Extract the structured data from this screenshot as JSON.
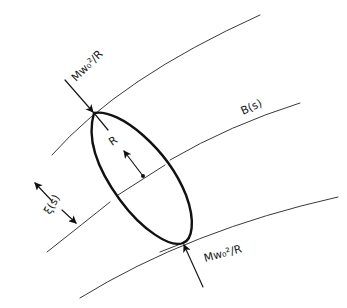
{
  "diagram": {
    "labels": {
      "force_top": "Mw₀²/R",
      "force_bottom": "Mw₀²/R",
      "radius": "R",
      "beam_path": "B(s)",
      "separation": "ξ(s)"
    },
    "elements": {
      "outer_curves": 2,
      "center_curve": "B(s)",
      "ellipse": "rotating ring of radius R",
      "arrows": [
        "force arrow top",
        "force arrow bottom",
        "radius arrow",
        "separation dimension arrows"
      ]
    },
    "colors": {
      "ink": "#111111",
      "thin_line": "#3a3a3a",
      "background": "#ffffff"
    }
  }
}
